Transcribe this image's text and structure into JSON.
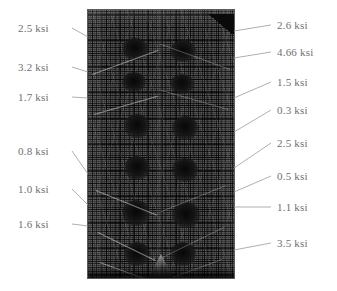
{
  "figure": {
    "units": "ksi",
    "mesh": {
      "name": "finite-element-mesh",
      "description": "grayscale finite element mesh of reinforced concrete specimen"
    },
    "callouts_left": [
      {
        "id": "left-1",
        "value": "2.5 ksi",
        "label_x": 18,
        "label_y": 22,
        "leader": {
          "x1": 72,
          "y1": 28,
          "x2": 88,
          "y2": 37
        }
      },
      {
        "id": "left-2",
        "value": "3.2 ksi",
        "label_x": 18,
        "label_y": 61,
        "leader": {
          "x1": 72,
          "y1": 67,
          "x2": 88,
          "y2": 72
        }
      },
      {
        "id": "left-3",
        "value": "1.7 ksi",
        "label_x": 18,
        "label_y": 91,
        "leader": {
          "x1": 72,
          "y1": 97,
          "x2": 88,
          "y2": 98
        }
      },
      {
        "id": "left-4",
        "value": "0.8 ksi",
        "label_x": 18,
        "label_y": 145,
        "leader": {
          "x1": 72,
          "y1": 151,
          "x2": 88,
          "y2": 174
        }
      },
      {
        "id": "left-5",
        "value": "1.0 ksi",
        "label_x": 18,
        "label_y": 183,
        "leader": {
          "x1": 72,
          "y1": 189,
          "x2": 88,
          "y2": 205
        }
      },
      {
        "id": "left-6",
        "value": "1.6 ksi",
        "label_x": 18,
        "label_y": 218,
        "leader": {
          "x1": 72,
          "y1": 224,
          "x2": 88,
          "y2": 226
        }
      }
    ],
    "callouts_right": [
      {
        "id": "right-1",
        "value": "2.6 ksi",
        "label_x": 277,
        "label_y": 19,
        "leader": {
          "x1": 234,
          "y1": 31,
          "x2": 271,
          "y2": 25
        }
      },
      {
        "id": "right-2",
        "value": "4.66 ksi",
        "label_x": 277,
        "label_y": 46,
        "leader": {
          "x1": 234,
          "y1": 58,
          "x2": 271,
          "y2": 52
        }
      },
      {
        "id": "right-3",
        "value": "1.5 ksi",
        "label_x": 277,
        "label_y": 76,
        "leader": {
          "x1": 234,
          "y1": 98,
          "x2": 271,
          "y2": 82
        }
      },
      {
        "id": "right-4",
        "value": "0.3 ksi",
        "label_x": 277,
        "label_y": 104,
        "leader": {
          "x1": 234,
          "y1": 132,
          "x2": 271,
          "y2": 110
        }
      },
      {
        "id": "right-5",
        "value": "2.5 ksi",
        "label_x": 277,
        "label_y": 137,
        "leader": {
          "x1": 234,
          "y1": 168,
          "x2": 271,
          "y2": 143
        }
      },
      {
        "id": "right-6",
        "value": "0.5 ksi",
        "label_x": 277,
        "label_y": 170,
        "leader": {
          "x1": 234,
          "y1": 192,
          "x2": 271,
          "y2": 176
        }
      },
      {
        "id": "right-7",
        "value": "1.1 ksi",
        "label_x": 277,
        "label_y": 201,
        "leader": {
          "x1": 234,
          "y1": 207,
          "x2": 271,
          "y2": 207
        }
      },
      {
        "id": "right-8",
        "value": "3.5 ksi",
        "label_x": 277,
        "label_y": 237,
        "leader": {
          "x1": 234,
          "y1": 250,
          "x2": 271,
          "y2": 243
        }
      }
    ],
    "blobs": [
      {
        "x": 34,
        "y": 28,
        "w": 26,
        "h": 22
      },
      {
        "x": 82,
        "y": 30,
        "w": 26,
        "h": 22
      },
      {
        "x": 34,
        "y": 62,
        "w": 24,
        "h": 20
      },
      {
        "x": 82,
        "y": 64,
        "w": 24,
        "h": 20
      },
      {
        "x": 36,
        "y": 104,
        "w": 26,
        "h": 24
      },
      {
        "x": 84,
        "y": 106,
        "w": 26,
        "h": 24
      },
      {
        "x": 36,
        "y": 146,
        "w": 26,
        "h": 24
      },
      {
        "x": 84,
        "y": 148,
        "w": 26,
        "h": 24
      },
      {
        "x": 34,
        "y": 190,
        "w": 28,
        "h": 26
      },
      {
        "x": 84,
        "y": 192,
        "w": 28,
        "h": 26
      },
      {
        "x": 36,
        "y": 232,
        "w": 26,
        "h": 24
      },
      {
        "x": 82,
        "y": 232,
        "w": 26,
        "h": 24
      }
    ],
    "struts": [
      {
        "x": 4,
        "y": 64,
        "len": 70,
        "rot": -20
      },
      {
        "x": 142,
        "y": 60,
        "len": 74,
        "rot": 200
      },
      {
        "x": 6,
        "y": 104,
        "len": 66,
        "rot": -16
      },
      {
        "x": 140,
        "y": 100,
        "len": 70,
        "rot": 196
      },
      {
        "x": 8,
        "y": 180,
        "len": 66,
        "rot": 22
      },
      {
        "x": 138,
        "y": 176,
        "len": 70,
        "rot": 158
      },
      {
        "x": 10,
        "y": 222,
        "len": 64,
        "rot": 26
      },
      {
        "x": 136,
        "y": 218,
        "len": 68,
        "rot": 154
      },
      {
        "x": 12,
        "y": 252,
        "len": 62,
        "rot": 20
      },
      {
        "x": 134,
        "y": 250,
        "len": 64,
        "rot": 160
      }
    ],
    "bands": [
      {
        "x": 0,
        "w": 14
      },
      {
        "x": 132,
        "w": 14
      },
      {
        "x": 68,
        "w": 8
      }
    ]
  }
}
